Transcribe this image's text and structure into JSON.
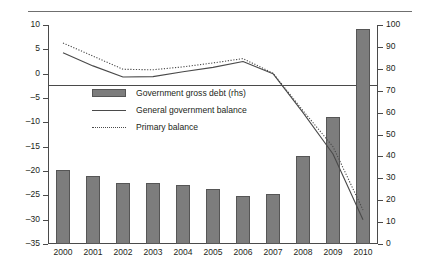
{
  "chart_data": {
    "type": "bar",
    "title": "",
    "subtitle": "",
    "xlabel": "",
    "ylabel": "",
    "categories": [
      "2000",
      "2001",
      "2002",
      "2003",
      "2004",
      "2005",
      "2006",
      "2007",
      "2008",
      "2009",
      "2010"
    ],
    "grid": false,
    "legend_position": "inside-left-upper-middle",
    "left_axis": {
      "label": "",
      "ylim": [
        -35,
        10
      ],
      "ticks": [
        "10",
        "5",
        "0",
        "-5",
        "-10",
        "-15",
        "-20",
        "-25",
        "-30",
        "-35"
      ],
      "tick_values": [
        10,
        5,
        0,
        -5,
        -10,
        -15,
        -20,
        -25,
        -30,
        -35
      ],
      "zero_reference_line": 0
    },
    "right_axis": {
      "label": "",
      "ylim": [
        0,
        100
      ],
      "ticks": [
        "100",
        "90",
        "80",
        "70",
        "60",
        "50",
        "40",
        "30",
        "20",
        "10",
        "0"
      ],
      "tick_values": [
        100,
        90,
        80,
        70,
        60,
        50,
        40,
        30,
        20,
        10,
        0
      ]
    },
    "series": [
      {
        "name": "Government gross debt (rhs)",
        "type": "bar",
        "axis": "right",
        "color": "#7d7d7d",
        "values": [
          34,
          31,
          28,
          28,
          27,
          25,
          22,
          23,
          40,
          58,
          98
        ]
      },
      {
        "name": "General government balance",
        "type": "line",
        "style": "solid",
        "axis": "left",
        "color": "#4a4a4a",
        "values": [
          4.3,
          1.6,
          -0.7,
          -0.6,
          0.4,
          1.3,
          2.5,
          0.0,
          -8.0,
          -16.5,
          -30.0
        ]
      },
      {
        "name": "Primary balance",
        "type": "line",
        "style": "dotted",
        "axis": "left",
        "color": "#4a4a4a",
        "values": [
          6.3,
          3.6,
          0.9,
          0.8,
          1.4,
          2.2,
          3.1,
          0.1,
          -7.6,
          -15.0,
          -28.0
        ]
      }
    ],
    "legend_entries": [
      "Government gross debt (rhs)",
      "General government balance",
      "Primary balance"
    ]
  }
}
